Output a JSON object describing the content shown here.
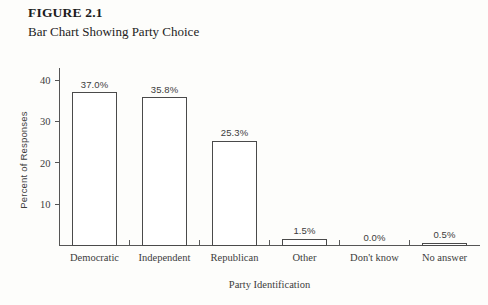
{
  "figure": {
    "number": "FIGURE 2.1",
    "title": "Bar Chart Showing Party Choice"
  },
  "chart_data": {
    "type": "bar",
    "title": "Bar Chart Showing Party Choice",
    "xlabel": "Party Identification",
    "ylabel": "Percent of Responses",
    "categories": [
      "Democratic",
      "Independent",
      "Republican",
      "Other",
      "Don't know",
      "No answer"
    ],
    "values": [
      37.0,
      35.8,
      25.3,
      1.5,
      0.0,
      0.5
    ],
    "value_labels": [
      "37.0%",
      "35.8%",
      "25.3%",
      "1.5%",
      "0.0%",
      "0.5%"
    ],
    "ylim": [
      0,
      43
    ],
    "yticks": [
      10,
      20,
      30,
      40
    ],
    "ytick_labels": [
      "10",
      "20",
      "30",
      "40"
    ],
    "grid": false,
    "legend": null,
    "bar_fill": "#ffffff",
    "bar_stroke": "#4a4a4a",
    "axis_color": "#555555",
    "background": "#fdfdfb"
  }
}
